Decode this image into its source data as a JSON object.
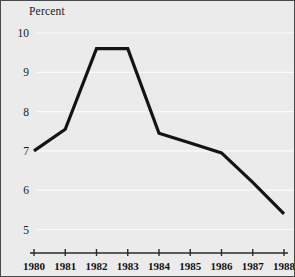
{
  "chart_data": {
    "type": "line",
    "title": "",
    "subtitle": "",
    "xlabel": "",
    "ylabel": "Percent",
    "ylabel_position": "top-left",
    "categories": [
      "1980",
      "1981",
      "1982",
      "1983",
      "1984",
      "1985",
      "1986",
      "1987",
      "1988"
    ],
    "x": [
      1980,
      1981,
      1982,
      1983,
      1984,
      1985,
      1986,
      1987,
      1988
    ],
    "values": [
      7.0,
      7.55,
      9.6,
      9.6,
      7.45,
      7.2,
      6.95,
      6.2,
      5.4
    ],
    "series": [
      {
        "name": "Percent",
        "values": [
          7.0,
          7.55,
          9.6,
          9.6,
          7.45,
          7.2,
          6.95,
          6.2,
          5.4
        ],
        "color": "#141414",
        "line_width": 3.2,
        "markers": false
      }
    ],
    "ylim": [
      4.55,
      10.3
    ],
    "xlim": [
      1980,
      1988
    ],
    "yticks": [
      10,
      9,
      8,
      7,
      6,
      5
    ],
    "ytick_labels": [
      "10",
      "9",
      "8",
      "7",
      "6",
      "5"
    ],
    "xticks": [
      1980,
      1981,
      1982,
      1983,
      1984,
      1985,
      1986,
      1987,
      1988
    ],
    "grid": {
      "horizontal": true,
      "vertical": false,
      "color": "#fbfbfb",
      "width": 1.2
    },
    "legend": {
      "visible": false,
      "position": "none",
      "entries": []
    },
    "annotations": [],
    "axis_line": {
      "bottom": true,
      "left": false,
      "color": "#2a2a2a",
      "tick_marks": 9
    }
  },
  "style": {
    "background": "#ebebeb",
    "page_background": "#ffffff",
    "border_color": "#4a4a4a",
    "text_color": "#1a1a1a",
    "line_color": "#141414",
    "gridline_color": "#fbfbfb"
  }
}
